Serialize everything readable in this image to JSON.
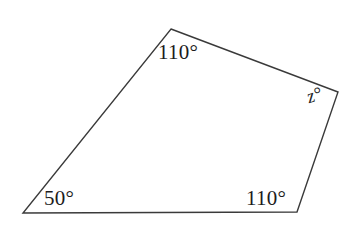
{
  "figure": {
    "kind": "quadrilateral-angle-diagram",
    "background_color": "#ffffff",
    "stroke_color": "#3a3a3a",
    "stroke_width": 1.4,
    "canvas": {
      "width": 360,
      "height": 231
    },
    "vertices": [
      {
        "name": "top-apex",
        "x": 171,
        "y": 29
      },
      {
        "name": "right",
        "x": 338,
        "y": 92
      },
      {
        "name": "bottom-right",
        "x": 297,
        "y": 212
      },
      {
        "name": "bottom-left",
        "x": 23,
        "y": 213
      }
    ],
    "path": "M 171,29 L 338,92 L 297,212 L 23,213 Z",
    "labels": {
      "top_apex": "110°",
      "right": "z°",
      "bottom_left": "50°",
      "bottom_right": "110°"
    }
  }
}
